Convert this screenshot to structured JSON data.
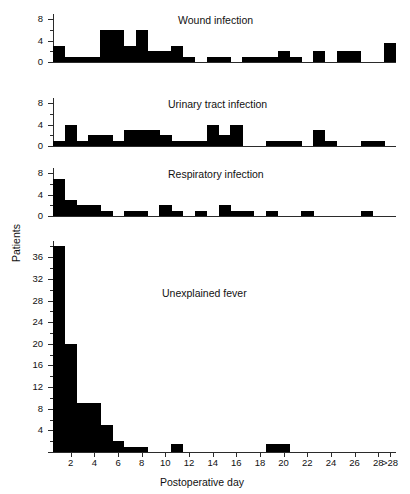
{
  "figure": {
    "y_axis_title": "Patients",
    "x_axis_title": "Postoperative day"
  },
  "chart_data": [
    {
      "type": "bar",
      "title": "Wound infection",
      "xlabel": "Postoperative day",
      "ylabel": "Patients",
      "ylim": [
        0,
        9
      ],
      "yticks": [
        0,
        4,
        8
      ],
      "ytick_labels": [
        "0",
        "4",
        "8"
      ],
      "grid": false,
      "legend": "none",
      "categories": [
        "1",
        "2",
        "3",
        "4",
        "5",
        "6",
        "7",
        "8",
        "9",
        "10",
        "11",
        "12",
        "13",
        "14",
        "15",
        "16",
        "17",
        "18",
        "19",
        "20",
        "21",
        "22",
        "23",
        "24",
        "25",
        "26",
        "27",
        "28",
        ">28"
      ],
      "values": [
        3,
        1,
        1,
        1,
        6,
        6,
        3,
        6,
        2,
        2,
        3,
        1,
        0,
        1,
        1,
        0,
        1,
        1,
        1,
        2,
        1,
        0,
        2,
        0,
        2,
        2,
        0,
        0,
        3.5
      ]
    },
    {
      "type": "bar",
      "title": "Urinary tract infection",
      "xlabel": "Postoperative day",
      "ylabel": "Patients",
      "ylim": [
        0,
        9
      ],
      "yticks": [
        0,
        4,
        8
      ],
      "ytick_labels": [
        "0",
        "4",
        "8"
      ],
      "grid": false,
      "legend": "none",
      "categories": [
        "1",
        "2",
        "3",
        "4",
        "5",
        "6",
        "7",
        "8",
        "9",
        "10",
        "11",
        "12",
        "13",
        "14",
        "15",
        "16",
        "17",
        "18",
        "19",
        "20",
        "21",
        "22",
        "23",
        "24",
        "25",
        "26",
        "27",
        "28",
        ">28"
      ],
      "values": [
        1,
        4,
        1,
        2,
        2,
        1,
        3,
        3,
        3,
        2,
        1,
        1,
        1,
        4,
        2,
        4,
        0,
        0,
        1,
        1,
        1,
        0,
        3,
        1,
        0,
        0,
        1,
        1,
        0
      ]
    },
    {
      "type": "bar",
      "title": "Respiratory infection",
      "xlabel": "Postoperative day",
      "ylabel": "Patients",
      "ylim": [
        0,
        9
      ],
      "yticks": [
        0,
        4,
        8
      ],
      "ytick_labels": [
        "0",
        "4",
        "8"
      ],
      "grid": false,
      "legend": "none",
      "categories": [
        "1",
        "2",
        "3",
        "4",
        "5",
        "6",
        "7",
        "8",
        "9",
        "10",
        "11",
        "12",
        "13",
        "14",
        "15",
        "16",
        "17",
        "18",
        "19",
        "20",
        "21",
        "22",
        "23",
        "24",
        "25",
        "26",
        "27",
        "28",
        ">28"
      ],
      "values": [
        7,
        3,
        2,
        2,
        1,
        0,
        1,
        1,
        0,
        2,
        1,
        0,
        1,
        0,
        2,
        1,
        1,
        0,
        1,
        0,
        0,
        1,
        0,
        0,
        0,
        0,
        1,
        0,
        0
      ]
    },
    {
      "type": "bar",
      "title": "Unexplained fever",
      "xlabel": "Postoperative day",
      "ylabel": "Patients",
      "ylim": [
        0,
        39
      ],
      "yticks": [
        0,
        4,
        8,
        12,
        16,
        20,
        24,
        28,
        32,
        36
      ],
      "ytick_labels": [
        "",
        "4",
        "8",
        "12",
        "16",
        "20",
        "24",
        "28",
        "32",
        "36"
      ],
      "grid": false,
      "legend": "none",
      "categories": [
        "1",
        "2",
        "3",
        "4",
        "5",
        "6",
        "7",
        "8",
        "9",
        "10",
        "11",
        "12",
        "13",
        "14",
        "15",
        "16",
        "17",
        "18",
        "19",
        "20",
        "21",
        "22",
        "23",
        "24",
        "25",
        "26",
        "27",
        "28",
        ">28"
      ],
      "values": [
        38,
        20,
        9,
        9,
        5,
        2,
        1,
        1,
        0,
        0,
        1.5,
        0,
        0,
        0,
        0,
        0,
        0,
        0,
        1.5,
        1.5,
        0,
        0,
        0,
        0,
        0,
        0,
        0,
        0,
        0
      ]
    }
  ],
  "x_axis": {
    "tick_values": [
      2,
      4,
      6,
      8,
      10,
      12,
      14,
      16,
      18,
      20,
      22,
      24,
      26,
      28,
      29
    ],
    "tick_labels": [
      "2",
      "4",
      "6",
      "8",
      "10",
      "12",
      "14",
      "16",
      "18",
      "20",
      "22",
      "24",
      "26",
      "28",
      ">28"
    ]
  }
}
